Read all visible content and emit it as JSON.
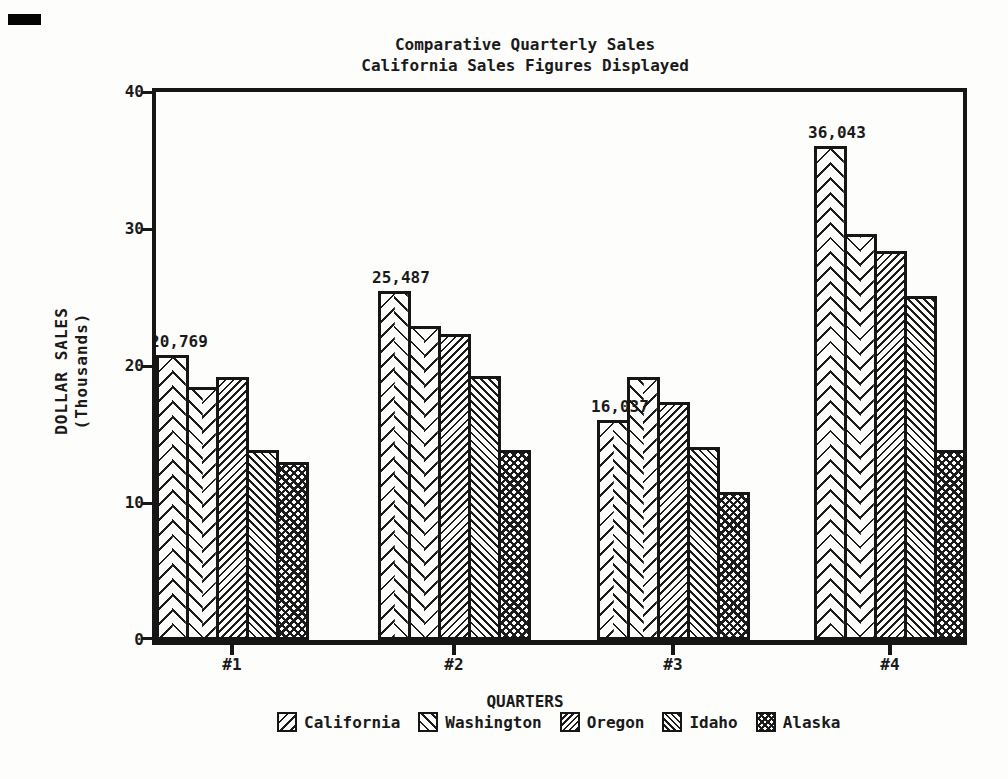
{
  "chart_data": {
    "type": "bar",
    "title": "Comparative Quarterly Sales",
    "subtitle": "California Sales Figures Displayed",
    "xlabel": "QUARTERS",
    "ylabel": "DOLLAR SALES (Thousands)",
    "ylabel_lines": [
      "DOLLAR SALES",
      "(Thousands)"
    ],
    "categories": [
      "#1",
      "#2",
      "#3",
      "#4"
    ],
    "series": [
      {
        "name": "California",
        "pattern": "herringbone-up",
        "values": [
          20.769,
          25.487,
          16.037,
          36.043
        ]
      },
      {
        "name": "Washington",
        "pattern": "herringbone-down",
        "values": [
          18.5,
          22.9,
          19.2,
          29.6
        ]
      },
      {
        "name": "Oregon",
        "pattern": "diagonal-up-dense",
        "values": [
          19.2,
          22.3,
          17.4,
          28.4
        ]
      },
      {
        "name": "Idaho",
        "pattern": "diagonal-down-dense",
        "values": [
          13.9,
          19.3,
          14.1,
          25.1
        ]
      },
      {
        "name": "Alaska",
        "pattern": "crosshatch",
        "values": [
          13.0,
          13.9,
          10.8,
          13.9
        ]
      }
    ],
    "data_labels": {
      "series": "California",
      "values": [
        "20,769",
        "25,487",
        "16,037",
        "36,043"
      ]
    },
    "ylim": [
      0,
      40
    ],
    "yticks": [
      40,
      30,
      20,
      10,
      0
    ],
    "grid": false,
    "legend_position": "bottom",
    "colors": {
      "ink": "#161616",
      "paper": "#fdfdfc"
    }
  }
}
